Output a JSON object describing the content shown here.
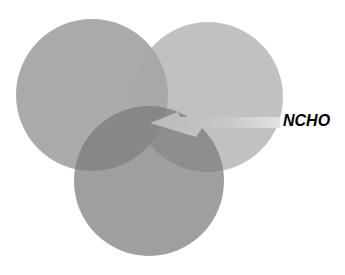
{
  "diagram": {
    "type": "venn",
    "circles": [
      {
        "id": "left",
        "cx": 92,
        "cy": 95,
        "r": 76,
        "color": "#8a8a8a"
      },
      {
        "id": "right",
        "cx": 208,
        "cy": 97,
        "r": 75,
        "color": "#a8a8a8"
      },
      {
        "id": "bottom",
        "cx": 149,
        "cy": 181,
        "r": 75,
        "color": "#7a7a7a"
      }
    ],
    "arrow": {
      "label": "NCHO",
      "points_to": "center-intersection"
    }
  }
}
